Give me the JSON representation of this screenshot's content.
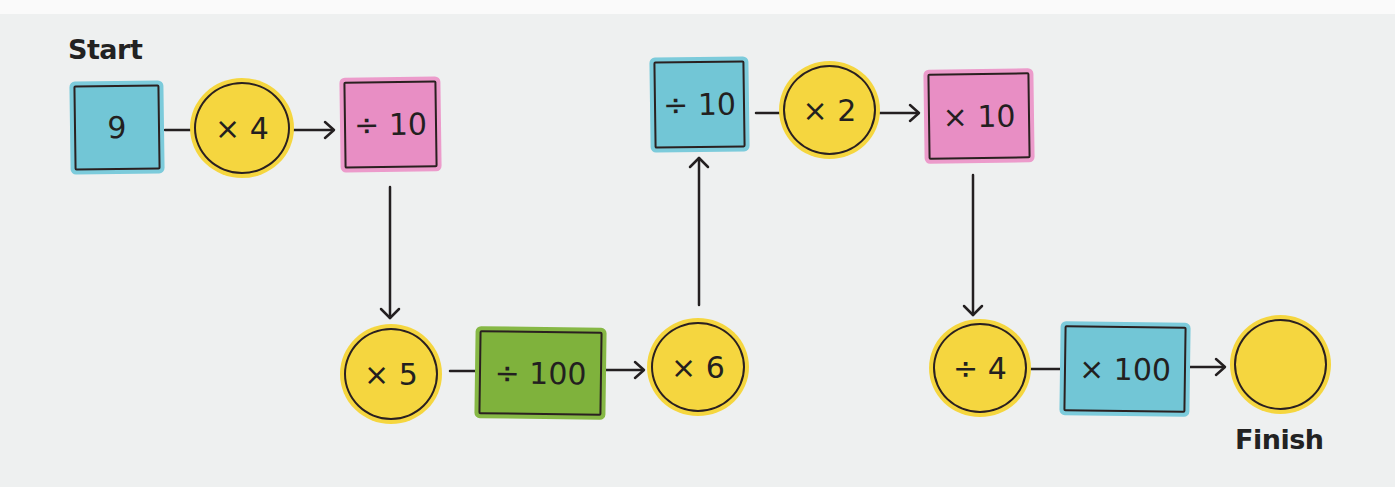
{
  "title_start": "Start",
  "title_finish": "Finish",
  "colors": {
    "background": "#eef0f0",
    "yellow": "#f5d63f",
    "blue": "#72c6d6",
    "pink": "#e88ec4",
    "green": "#7fb23c",
    "stroke": "#231f20"
  },
  "nodes": [
    {
      "id": "n1",
      "shape": "square",
      "color": "blue",
      "label": "9"
    },
    {
      "id": "n2",
      "shape": "circle",
      "color": "yellow",
      "label": "× 4"
    },
    {
      "id": "n3",
      "shape": "square",
      "color": "pink",
      "label": "÷ 10"
    },
    {
      "id": "n4",
      "shape": "circle",
      "color": "yellow",
      "label": "× 5"
    },
    {
      "id": "n5",
      "shape": "square",
      "color": "green",
      "label": "÷ 100"
    },
    {
      "id": "n6",
      "shape": "circle",
      "color": "yellow",
      "label": "× 6"
    },
    {
      "id": "n7",
      "shape": "square",
      "color": "blue",
      "label": "÷ 10"
    },
    {
      "id": "n8",
      "shape": "circle",
      "color": "yellow",
      "label": "× 2"
    },
    {
      "id": "n9",
      "shape": "square",
      "color": "pink",
      "label": "× 10"
    },
    {
      "id": "n10",
      "shape": "circle",
      "color": "yellow",
      "label": "÷ 4"
    },
    {
      "id": "n11",
      "shape": "square",
      "color": "blue",
      "label": "× 100"
    },
    {
      "id": "n12",
      "shape": "circle",
      "color": "yellow",
      "label": ""
    }
  ],
  "edges": [
    {
      "from": "n1",
      "to": "n2",
      "arrow": false
    },
    {
      "from": "n2",
      "to": "n3",
      "arrow": true
    },
    {
      "from": "n3",
      "to": "n4",
      "arrow": true
    },
    {
      "from": "n4",
      "to": "n5",
      "arrow": false
    },
    {
      "from": "n5",
      "to": "n6",
      "arrow": true
    },
    {
      "from": "n6",
      "to": "n7",
      "arrow": true
    },
    {
      "from": "n7",
      "to": "n8",
      "arrow": false
    },
    {
      "from": "n8",
      "to": "n9",
      "arrow": true
    },
    {
      "from": "n9",
      "to": "n10",
      "arrow": true
    },
    {
      "from": "n10",
      "to": "n11",
      "arrow": false
    },
    {
      "from": "n11",
      "to": "n12",
      "arrow": true
    }
  ]
}
